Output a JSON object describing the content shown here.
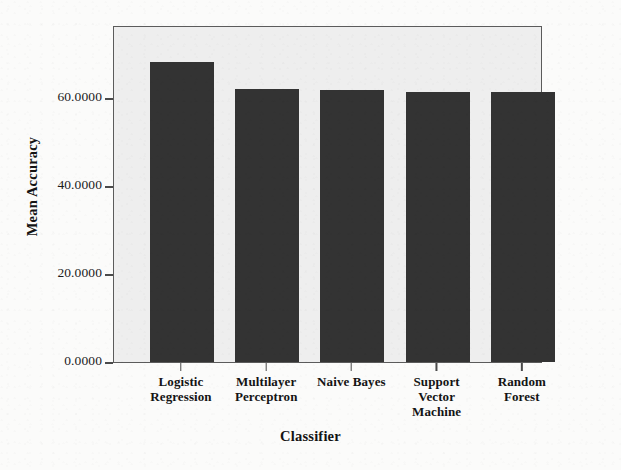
{
  "chart_data": {
    "type": "bar",
    "title": "",
    "subtitle": "",
    "xlabel": "Classifier",
    "ylabel": "Mean Accuracy",
    "categories": [
      "Logistic\nRegression",
      "Multilayer\nPerceptron",
      "Naive Bayes",
      "Support\nVector\nMachine",
      "Random\nForest"
    ],
    "values": [
      68.1,
      62.0,
      61.8,
      61.4,
      61.4
    ],
    "ylim": [
      0,
      76.6
    ],
    "yticks": [
      0,
      20,
      40,
      60
    ],
    "ytick_labels": [
      "0.0000",
      "20.0000",
      "40.0000",
      "60.0000"
    ],
    "grid": false,
    "legend": false,
    "bar_color": "#333333",
    "plot_background": "#eeeeee",
    "figure_background": "#fbfbfa",
    "axis_color": "#5b5b5b"
  }
}
